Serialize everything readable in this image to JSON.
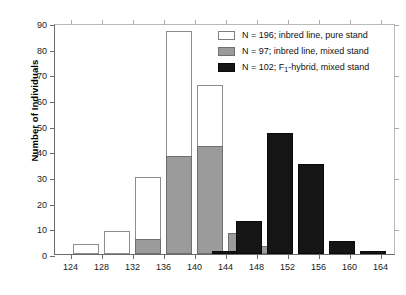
{
  "chart_data": {
    "type": "bar",
    "title": "",
    "xlabel": "",
    "ylabel": "Number of Individuals",
    "xlim": [
      122,
      166
    ],
    "ylim": [
      0,
      90
    ],
    "ytick_labels": [
      "0",
      "10",
      "20",
      "30",
      "40",
      "50",
      "60",
      "70",
      "80",
      "90"
    ],
    "ytick_values": [
      0,
      10,
      20,
      30,
      40,
      50,
      60,
      70,
      80,
      90
    ],
    "xtick_labels": [
      "124",
      "128",
      "132",
      "136",
      "140",
      "144",
      "148",
      "152",
      "156",
      "160",
      "164"
    ],
    "xtick_values": [
      124,
      128,
      132,
      136,
      140,
      144,
      148,
      152,
      156,
      160,
      164
    ],
    "grid": false,
    "legend_position": "top-right",
    "bin_width": 4,
    "series": [
      {
        "name": "N = 196; inbred line, pure stand",
        "n": 196,
        "fill": "#ffffff",
        "edge": "#8d8d8d",
        "bins": [
          126,
          130,
          134,
          138,
          142,
          146
        ],
        "values": [
          4,
          9,
          30,
          87,
          66,
          2
        ]
      },
      {
        "name": "N = 97; inbred line, mixed stand",
        "n": 97,
        "fill": "#9b9b9b",
        "edge": "#6f6f6f",
        "bins": [
          134,
          138,
          142,
          146,
          150
        ],
        "values": [
          6,
          38,
          42,
          8,
          3
        ]
      },
      {
        "name": "N = 102; F1-hybrid, mixed stand",
        "n": 102,
        "fill": "#151515",
        "edge": "#0a0a0a",
        "bins": [
          144,
          147,
          151,
          155,
          159,
          163
        ],
        "values": [
          1,
          13,
          47,
          35,
          5,
          1
        ]
      }
    ]
  },
  "legend": {
    "items": [
      {
        "swatch": "white",
        "prefix": "N = 196; inbred line, pure stand",
        "sub": "",
        "suffix": ""
      },
      {
        "swatch": "gray",
        "prefix": "N = 97; inbred line, mixed stand",
        "sub": "",
        "suffix": ""
      },
      {
        "swatch": "black",
        "prefix": "N = 102; F",
        "sub": "1",
        "suffix": "-hybrid, mixed stand"
      }
    ]
  },
  "axes": {
    "y_title": "Number of Individuals"
  }
}
